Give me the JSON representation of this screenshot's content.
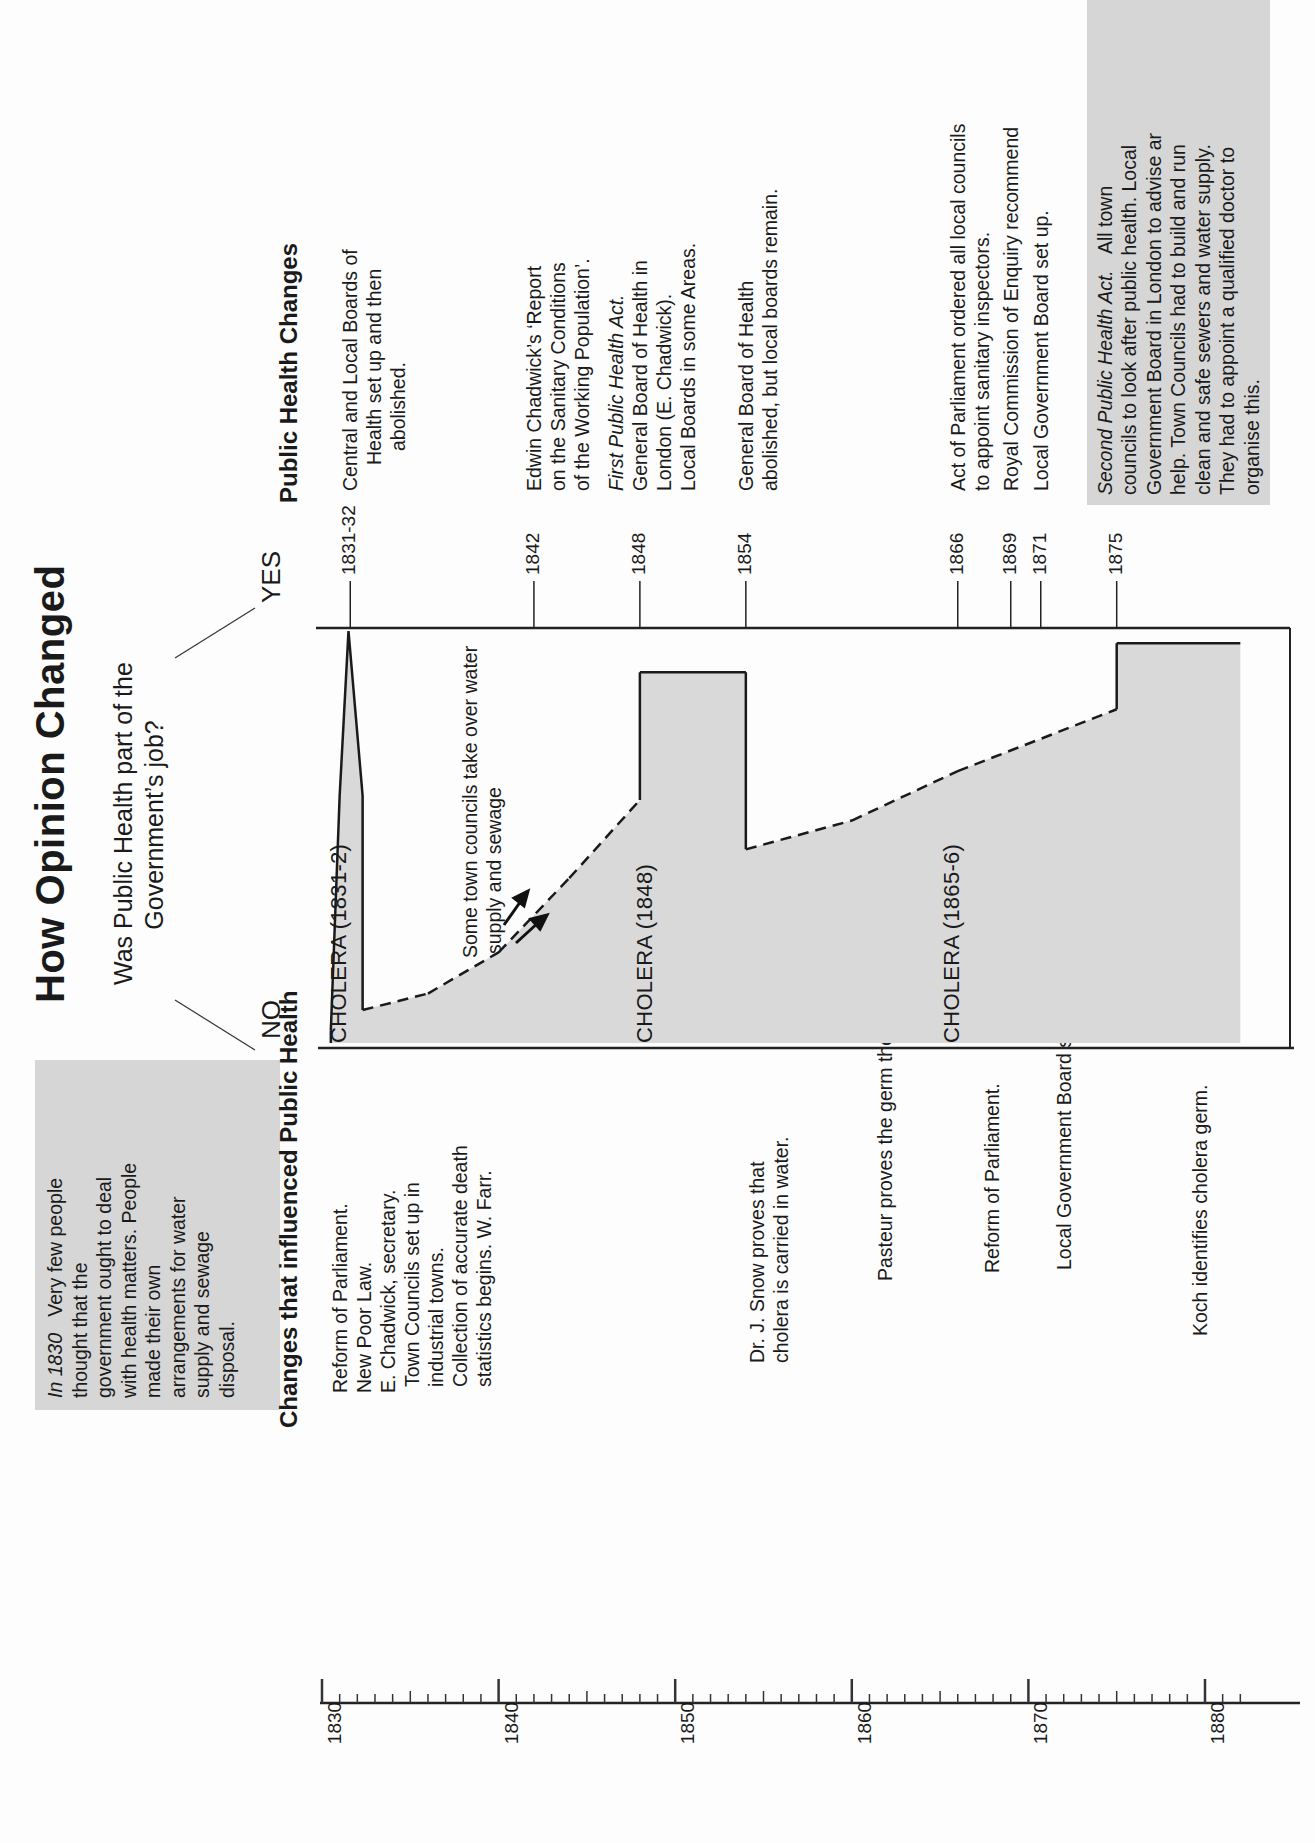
{
  "title": "How Opinion Changed",
  "question": {
    "line1": "Was Public Health  part of the",
    "line2": "Government’s job?",
    "no_label": "NO",
    "yes_label": "YES"
  },
  "intro_note": {
    "lead": "In 1830",
    "text_lines": [
      "Very few people",
      "thought that the",
      "government ought to deal",
      "with health matters. People",
      "made their own",
      "arrangements for water",
      "supply and sewage",
      "disposal."
    ]
  },
  "left_panel": {
    "heading": "Changes that influenced Public Health",
    "events": [
      {
        "lines": [
          "Reform of Parliament.",
          "New Poor Law.",
          "E. Chadwick, secretary.",
          "Town Councils set up in",
          "industrial towns.",
          "Collection of accurate death",
          "statistics begins. W. Farr."
        ]
      },
      {
        "lines": [
          "Dr. J. Snow proves that",
          "cholera is carried in water."
        ]
      },
      {
        "lines": [
          "Pasteur proves the germ  theory."
        ]
      },
      {
        "lines": [
          "Reform of Parliament."
        ]
      },
      {
        "lines": [
          "Local Government Board set up."
        ]
      },
      {
        "lines": [
          "Koch identifies cholera  germ."
        ]
      }
    ]
  },
  "timeline_axis": {
    "labels": [
      "1830",
      "1840",
      "1850",
      "1860",
      "1870",
      "1880"
    ]
  },
  "right_panel": {
    "heading": "Public Health Changes",
    "events": [
      {
        "year": "1831-32",
        "lines": [
          "Central and Local Boards of",
          "Health set up and then",
          "abolished."
        ]
      },
      {
        "year": "1842",
        "lines": [
          "Edwin Chadwick’s ‘Report",
          "on the Sanitary Conditions",
          "of the Working Population’."
        ]
      },
      {
        "year": "1848",
        "italic_line": "First Public Health Act.",
        "lines": [
          "General Board of Health in",
          "London (E. Chadwick).",
          "Local Boards in some  Areas."
        ]
      },
      {
        "year": "1854",
        "lines": [
          "General Board of Health",
          "abolished, but local boards  remain."
        ]
      },
      {
        "year": "1866",
        "lines": [
          "Act of Parliament ordered  all local councils",
          "to appoint  sanitary inspectors."
        ]
      },
      {
        "year": "1869",
        "lines": [
          "Royal Commission of  Enquiry recommend"
        ]
      },
      {
        "year": "1871",
        "lines": [
          "Local Government Board set up."
        ]
      },
      {
        "year": "1875",
        "italic_lead": "Second Public  Health Act.",
        "lines": [
          "All town",
          "councils to look after public  health. Local",
          "Government  Board in London to advise ar",
          "help. Town Councils had to build and run",
          "clean and safe sewers and water supply.",
          "They had to appoint  a qualified doctor to",
          "organise this."
        ]
      }
    ]
  },
  "chart_labels": {
    "cholera_1831": "CHOLERA (1831-2)",
    "cholera_1848": "CHOLERA (1848)",
    "cholera_1865": "CHOLERA (1865-6)",
    "annotation_line1": "Some town councils take over water",
    "annotation_line2": "supply and sewage"
  },
  "chart_data": {
    "type": "area",
    "title": "How Opinion Changed",
    "subtitle": "Was Public Health part of the Government's job?",
    "orientation": "years run down the page; opinion axis runs from NO (left) to YES (right)",
    "xlabel": "Year",
    "ylabel": "Opinion (0 = NO, 100 = YES)",
    "xlim": [
      1830,
      1882
    ],
    "ylim": [
      0,
      100
    ],
    "x_ticks": [
      1830,
      1840,
      1850,
      1860,
      1870,
      1880
    ],
    "points": [
      {
        "year": 1830.5,
        "opinion": 3,
        "style": "solid"
      },
      {
        "year": 1831,
        "opinion": 60,
        "style": "solid",
        "note": "cholera spike"
      },
      {
        "year": 1831.5,
        "opinion": 100,
        "style": "solid"
      },
      {
        "year": 1832.3,
        "opinion": 60,
        "style": "solid"
      },
      {
        "year": 1832.3,
        "opinion": 8,
        "style": "solid"
      },
      {
        "year": 1836,
        "opinion": 12,
        "style": "dashed"
      },
      {
        "year": 1840,
        "opinion": 22,
        "style": "dashed"
      },
      {
        "year": 1844,
        "opinion": 40,
        "style": "dashed"
      },
      {
        "year": 1848,
        "opinion": 59,
        "style": "dashed"
      },
      {
        "year": 1848,
        "opinion": 90,
        "style": "solid"
      },
      {
        "year": 1854,
        "opinion": 90,
        "style": "solid"
      },
      {
        "year": 1854,
        "opinion": 47,
        "style": "solid"
      },
      {
        "year": 1860,
        "opinion": 54,
        "style": "dashed"
      },
      {
        "year": 1866,
        "opinion": 66,
        "style": "dashed"
      },
      {
        "year": 1875,
        "opinion": 81,
        "style": "dashed"
      },
      {
        "year": 1875,
        "opinion": 97,
        "style": "solid"
      },
      {
        "year": 1882,
        "opinion": 97,
        "style": "solid"
      }
    ],
    "annotations": [
      {
        "year": 1831.5,
        "text": "CHOLERA (1831-2)"
      },
      {
        "year": 1848,
        "text": "CHOLERA (1848)"
      },
      {
        "year": 1865.5,
        "text": "CHOLERA (1865-6)"
      },
      {
        "year": 1844,
        "text": "Some town councils take over water supply and sewage"
      }
    ],
    "event_markers": [
      "1831-32",
      "1842",
      "1848",
      "1854",
      "1866",
      "1869",
      "1871",
      "1875"
    ],
    "fill_color": "#d9d9d9",
    "grid": false,
    "legend": "none"
  }
}
